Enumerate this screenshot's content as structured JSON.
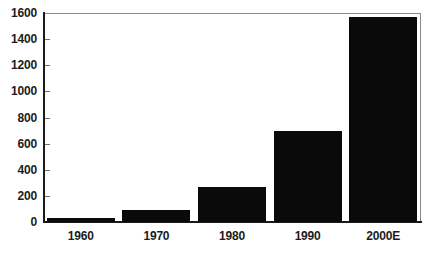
{
  "chart_data": {
    "type": "bar",
    "title": "",
    "subtitle": "",
    "xlabel": "",
    "ylabel": "",
    "categories": [
      "1960",
      "1970",
      "1980",
      "1990",
      "2000E"
    ],
    "values": [
      30,
      90,
      270,
      695,
      1570
    ],
    "series": [
      {
        "name": "",
        "values": [
          30,
          90,
          270,
          695,
          1570
        ]
      }
    ],
    "ylim": [
      0,
      1600
    ],
    "yticks": [
      0,
      200,
      400,
      600,
      800,
      1000,
      1200,
      1400,
      1600
    ],
    "ytick_labels": [
      "0",
      "200",
      "400",
      "600",
      "800",
      "1000",
      "1200",
      "1400",
      "1600"
    ],
    "grid": false,
    "legend": false,
    "legend_position": "none",
    "annotations": [],
    "bar_color": "#0a0a0a",
    "background_color": "#ffffff",
    "axis_color": "#1a1a1a",
    "plot_border_color": "#8a8a8a"
  }
}
